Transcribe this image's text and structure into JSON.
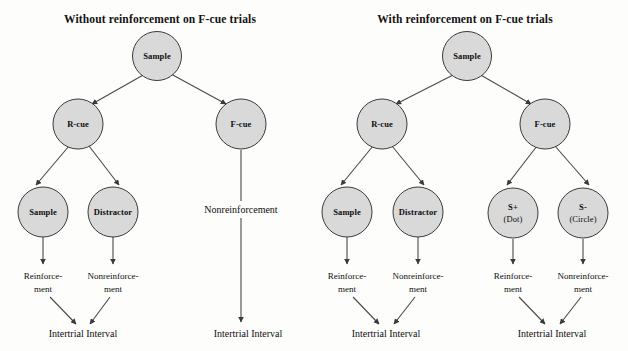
{
  "figure": {
    "background_color": "#fdfdfb",
    "node_fill_color": "#d9d9d9",
    "node_stroke_color": "#3a3a3a",
    "text_color": "#0d0d0d"
  },
  "panels": [
    {
      "id": "left",
      "title": "Without reinforcement on F-cue trials",
      "nodes": {
        "sample_root": "Sample",
        "r_cue": "R-cue",
        "f_cue": "F-cue",
        "sample_leaf": "Sample",
        "distractor_leaf": "Distractor"
      },
      "outcomes": {
        "reinforcement_line1": "Reinforce-",
        "reinforcement_line2": "ment",
        "nonreinforcement_line1": "Nonreinforce-",
        "nonreinforcement_line2": "ment",
        "f_cue_nonreinforcement": "Nonreinforcement"
      },
      "terminals": {
        "r_branch": "Intertrial Interval",
        "f_branch": "Intertrial Interval"
      }
    },
    {
      "id": "right",
      "title": "With  reinforcement on F-cue trials",
      "nodes": {
        "sample_root": "Sample",
        "r_cue": "R-cue",
        "f_cue": "F-cue",
        "sample_leaf": "Sample",
        "distractor_leaf": "Distractor",
        "s_plus_line1": "S+",
        "s_plus_line2": "(Dot)",
        "s_minus_line1": "S-",
        "s_minus_line2": "(Circle)"
      },
      "outcomes": {
        "r_reinforcement_line1": "Reinforce-",
        "r_reinforcement_line2": "ment",
        "r_nonreinforcement_line1": "Nonreinforce-",
        "r_nonreinforcement_line2": "ment",
        "f_reinforcement_line1": "Reinforce-",
        "f_reinforcement_line2": "ment",
        "f_nonreinforcement_line1": "Nonreinforce-",
        "f_nonreinforcement_line2": "ment"
      },
      "terminals": {
        "r_branch": "Intertrial Interval",
        "f_branch": "Intertrial Interval"
      }
    }
  ]
}
